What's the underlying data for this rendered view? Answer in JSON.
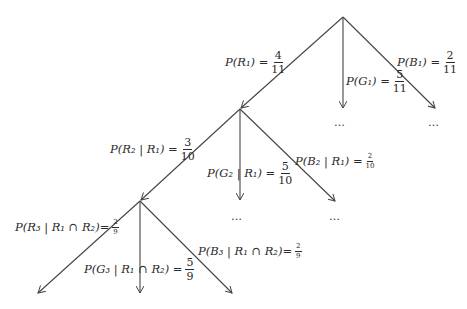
{
  "tree": {
    "level1": [
      {
        "label": "P(R₁) = ",
        "num": "4",
        "den": "11"
      },
      {
        "label": "P(G₁) = ",
        "num": "5",
        "den": "11"
      },
      {
        "label": "P(B₁) = ",
        "num": "2",
        "den": "11"
      }
    ],
    "level2": [
      {
        "label": "P(R₂ | R₁) = ",
        "num": "3",
        "den": "10"
      },
      {
        "label": "P(G₂ | R₁) = ",
        "num": "5",
        "den": "10"
      },
      {
        "label": "P(B₂ | R₁) = ",
        "num": "2",
        "den": "10"
      }
    ],
    "level3": [
      {
        "label": "P(R₃ | R₁ ∩ R₂)=",
        "num": "2",
        "den": "9"
      },
      {
        "label": "P(G₃ | R₁ ∩ R₂) = ",
        "num": "5",
        "den": "9"
      },
      {
        "label": "P(B₃ | R₁ ∩ R₂)=",
        "num": "2",
        "den": "9"
      }
    ],
    "ellipsis": "…"
  }
}
